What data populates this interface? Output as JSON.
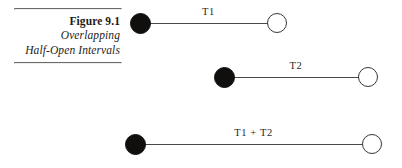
{
  "figure": {
    "caption": {
      "title": "Figure 9.1",
      "subtitle_line1": "Overlapping",
      "subtitle_line2": "Half-Open Intervals"
    },
    "background_color": "#ffffff",
    "line_color": "#4a4744",
    "closed_endpoint_color": "#100f0e",
    "open_endpoint_color": "#ffffff",
    "rule_color": "#6d6a66"
  },
  "chart_data": {
    "type": "timeline",
    "title": "Figure 9.1",
    "subtitle": "Overlapping Half-Open Intervals",
    "xlabel": "",
    "ylabel": "",
    "grid": false,
    "legend": "none",
    "intervals": [
      {
        "name": "T1",
        "label": "T1",
        "left_endpoint": "closed",
        "right_endpoint": "open",
        "start_px": 140,
        "end_px": 277,
        "row_y_px": 24,
        "length_px": 137
      },
      {
        "name": "T2",
        "label": "T2",
        "left_endpoint": "closed",
        "right_endpoint": "open",
        "start_px": 224,
        "end_px": 368,
        "row_y_px": 78,
        "length_px": 144
      },
      {
        "name": "T1 + T2",
        "label": "T1 + T2",
        "left_endpoint": "closed",
        "right_endpoint": "open",
        "start_px": 135,
        "end_px": 372,
        "row_y_px": 145,
        "length_px": 237
      }
    ]
  }
}
